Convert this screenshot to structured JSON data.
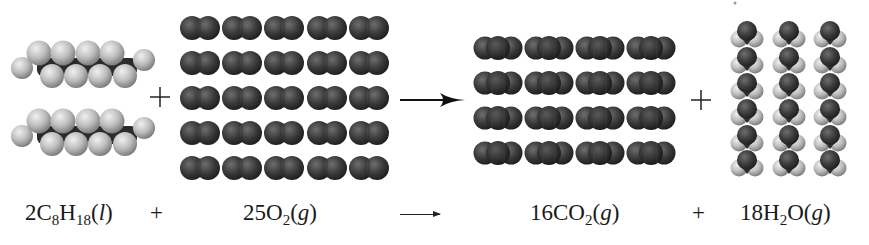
{
  "diagram": {
    "reactants": [
      {
        "id": "octane",
        "coefficient": "2",
        "formula_parts": [
          "C",
          "8",
          "H",
          "18"
        ],
        "state": "l",
        "molecule_count": 2,
        "layout": "2 stacked chains",
        "colors": {
          "carbon": "#3a3a3a",
          "hydrogen": "#c8c8c8"
        }
      },
      {
        "id": "oxygen",
        "coefficient": "25",
        "formula_parts": [
          "O",
          "2"
        ],
        "state": "g",
        "molecule_count": 25,
        "layout": "5x5 grid",
        "colors": {
          "oxygen": "#3c3c3c"
        }
      }
    ],
    "products": [
      {
        "id": "carbon-dioxide",
        "coefficient": "16",
        "formula_parts": [
          "CO",
          "2"
        ],
        "state": "g",
        "molecule_count": 16,
        "layout": "4x4 grid",
        "colors": {
          "carbon": "#333333",
          "oxygen": "#454545"
        }
      },
      {
        "id": "water",
        "coefficient": "18",
        "formula_parts": [
          "H",
          "2",
          "O"
        ],
        "state": "g",
        "molecule_count": 18,
        "layout": "3 columns x 6 rows",
        "colors": {
          "oxygen": "#3a3a3a",
          "hydrogen": "#c4c4c4"
        }
      }
    ],
    "operators": {
      "plus": "+",
      "arrow": "→"
    }
  },
  "equation": {
    "octane": {
      "coef": "2",
      "el1": "C",
      "sub1": "8",
      "el2": "H",
      "sub2": "18",
      "state_open": "(",
      "state": "l",
      "state_close": ")"
    },
    "plus1": "+",
    "oxygen": {
      "coef": "25",
      "el1": "O",
      "sub1": "2",
      "state_open": "(",
      "state": "g",
      "state_close": ")"
    },
    "co2": {
      "coef": "16",
      "el1": "CO",
      "sub1": "2",
      "state_open": "(",
      "state": "g",
      "state_close": ")"
    },
    "plus2": "+",
    "water": {
      "coef": "18",
      "el1": "H",
      "sub1": "2",
      "el2": "O",
      "state_open": "(",
      "state": "g",
      "state_close": ")"
    }
  }
}
